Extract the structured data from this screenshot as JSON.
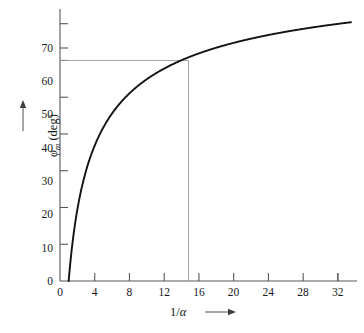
{
  "chart_data": {
    "type": "line",
    "title": "",
    "subtitle": "",
    "xlabel": "1/α",
    "ylabel": "φm (deg)",
    "xlabel_symbol_numerator": "1/",
    "xlabel_symbol_alpha": "α",
    "ylabel_phi": "φ",
    "ylabel_sub": "m",
    "ylabel_units": " (deg)",
    "xlim": [
      0,
      34.2
    ],
    "ylim": [
      0,
      74
    ],
    "xticks": [
      0,
      4,
      8,
      12,
      16,
      20,
      24,
      28,
      32
    ],
    "xticklabels": [
      "0",
      "4",
      "8",
      "12",
      "16",
      "20",
      "24",
      "28",
      "32"
    ],
    "xminor_ticks": [
      2,
      6,
      10,
      14,
      18,
      22,
      26,
      30
    ],
    "yticks": [
      0,
      10,
      20,
      30,
      40,
      50,
      60,
      70
    ],
    "yticklabels": [
      "0",
      "10",
      "20",
      "30",
      "40",
      "50",
      "60",
      "70"
    ],
    "grid": false,
    "legend": null,
    "legend_position": "none",
    "curve_color": "#131313",
    "guide_color": "#9a9a9c",
    "axis_color": "#55575a",
    "x_axis_arrow": true,
    "y_axis_arrow": true,
    "annotations": [
      {
        "name": "sixty-degree-guide",
        "type": "crosshair",
        "x": 14.8,
        "y": 60,
        "description": "horizontal line at phi_m = 60 deg meeting vertical line at 1/alpha = 14.8"
      }
    ],
    "series": [
      {
        "name": "phi_m",
        "formula": "phi_m = arcsin((1/alpha - 1)/(1/alpha + 1))",
        "x": [
          1.0,
          1.2,
          1.5,
          1.8,
          2.0,
          2.5,
          3.0,
          3.5,
          4.0,
          4.5,
          5.0,
          6.0,
          7.0,
          8.0,
          9.0,
          10.0,
          11.0,
          12.0,
          13.0,
          14.0,
          14.8,
          16.0,
          18.0,
          20.0,
          22.0,
          24.0,
          26.0,
          28.0,
          30.0,
          32.0,
          33.5
        ],
        "values": [
          0.0,
          5.3,
          11.5,
          16.4,
          19.5,
          25.4,
          30.0,
          33.7,
          36.9,
          39.6,
          41.8,
          45.6,
          48.6,
          51.1,
          53.1,
          54.9,
          56.4,
          57.8,
          59.0,
          60.1,
          60.8,
          62.2,
          63.9,
          65.4,
          66.6,
          67.7,
          68.6,
          69.4,
          70.1,
          70.8,
          71.2
        ],
        "display_x_end": 33.5,
        "display_y_end": 67.2
      }
    ]
  },
  "figure": {
    "name": "phase-margin-vs-one-over-alpha-plot",
    "background": "#ffffff"
  }
}
